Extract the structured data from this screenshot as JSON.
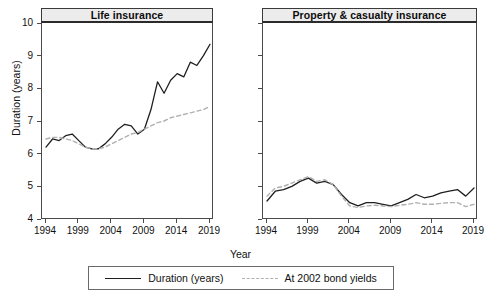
{
  "chart_data": {
    "type": "line",
    "title": "",
    "xlabel": "Year",
    "ylabel": "Duration (years)",
    "xlim": [
      1994,
      2019
    ],
    "ylim": [
      4,
      10
    ],
    "grid": false,
    "legend_position": "bottom",
    "legend": [
      {
        "name": "Duration (years)",
        "style": "solid",
        "color": "#1f1f1f"
      },
      {
        "name": "At 2002 bond yields",
        "style": "dashed",
        "color": "#b0b0b0"
      }
    ],
    "yticks": [
      4,
      5,
      6,
      7,
      8,
      9,
      10
    ],
    "xticks": [
      1994,
      1999,
      2004,
      2009,
      2014,
      2019
    ],
    "panels": [
      {
        "title": "Life insurance",
        "x": [
          1994,
          1995,
          1996,
          1997,
          1998,
          1999,
          2000,
          2001,
          2002,
          2003,
          2004,
          2005,
          2006,
          2007,
          2008,
          2009,
          2010,
          2011,
          2012,
          2013,
          2014,
          2015,
          2016,
          2017,
          2018,
          2019
        ],
        "series": [
          {
            "name": "Duration (years)",
            "style": "solid",
            "color": "#1f1f1f",
            "values": [
              6.2,
              6.45,
              6.4,
              6.55,
              6.6,
              6.4,
              6.2,
              6.15,
              6.15,
              6.3,
              6.5,
              6.75,
              6.9,
              6.85,
              6.6,
              6.75,
              7.35,
              8.2,
              7.85,
              8.25,
              8.45,
              8.35,
              8.8,
              8.7,
              9.0,
              9.35
            ]
          },
          {
            "name": "At 2002 bond yields",
            "style": "dashed",
            "color": "#b0b0b0",
            "values": [
              6.45,
              6.5,
              6.5,
              6.45,
              6.4,
              6.3,
              6.2,
              6.15,
              6.15,
              6.2,
              6.3,
              6.4,
              6.5,
              6.6,
              6.65,
              6.75,
              6.85,
              6.95,
              7.0,
              7.1,
              7.15,
              7.2,
              7.25,
              7.3,
              7.35,
              7.45
            ]
          }
        ]
      },
      {
        "title": "Property & casualty insurance",
        "x": [
          1994,
          1995,
          1996,
          1997,
          1998,
          1999,
          2000,
          2001,
          2002,
          2003,
          2004,
          2005,
          2006,
          2007,
          2008,
          2009,
          2010,
          2011,
          2012,
          2013,
          2014,
          2015,
          2016,
          2017,
          2018,
          2019
        ],
        "series": [
          {
            "name": "Duration (years)",
            "style": "solid",
            "color": "#1f1f1f",
            "values": [
              4.55,
              4.85,
              4.9,
              5.0,
              5.15,
              5.25,
              5.1,
              5.15,
              5.05,
              4.75,
              4.5,
              4.4,
              4.5,
              4.5,
              4.45,
              4.4,
              4.5,
              4.6,
              4.75,
              4.65,
              4.7,
              4.8,
              4.85,
              4.9,
              4.7,
              4.95
            ]
          },
          {
            "name": "At 2002 bond yields",
            "style": "dashed",
            "color": "#b0b0b0",
            "values": [
              4.7,
              4.95,
              5.0,
              5.1,
              5.2,
              5.3,
              5.15,
              5.2,
              5.05,
              4.7,
              4.4,
              4.35,
              4.4,
              4.42,
              4.4,
              4.38,
              4.42,
              4.45,
              4.5,
              4.45,
              4.45,
              4.48,
              4.5,
              4.5,
              4.38,
              4.45
            ]
          }
        ]
      }
    ]
  }
}
